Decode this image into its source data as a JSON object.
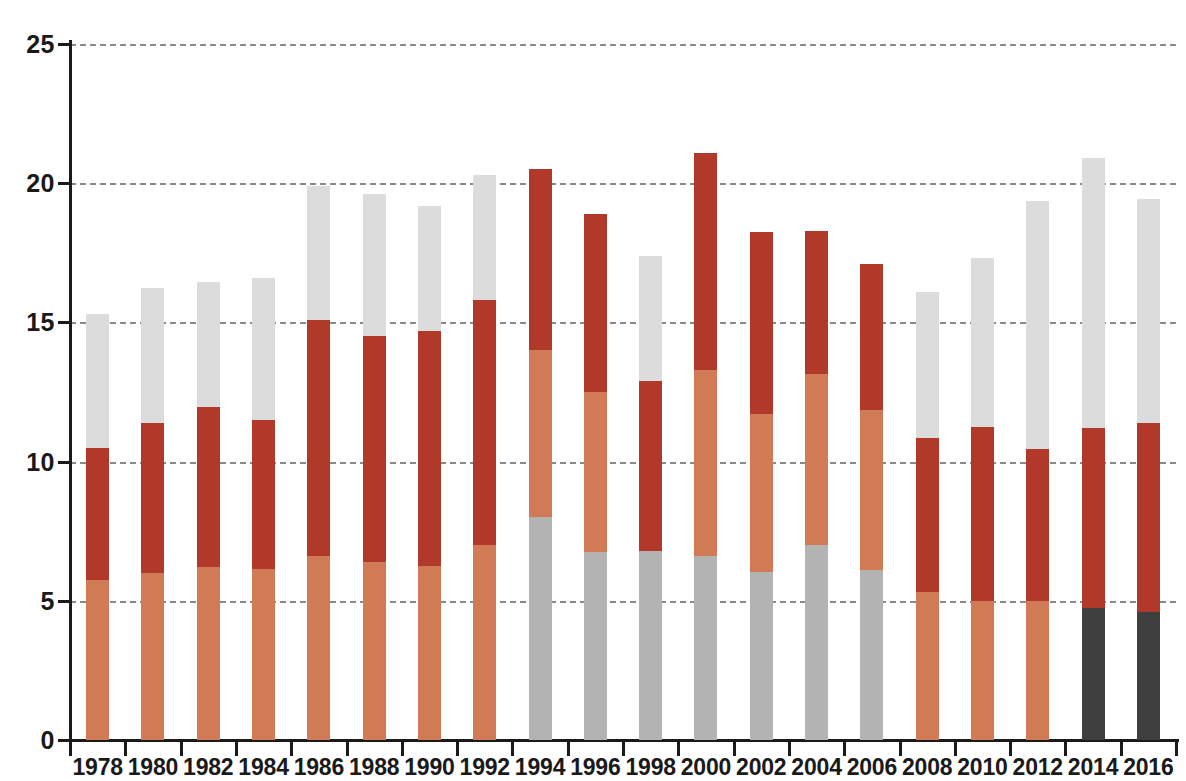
{
  "title": "",
  "axes": {
    "y_ticks": [
      0,
      5,
      10,
      15,
      20,
      25
    ],
    "y_min": 0,
    "y_max": 25,
    "x_ticks": [
      "1978",
      "1980",
      "1982",
      "1984",
      "1986",
      "1988",
      "1990",
      "1992",
      "1994",
      "1996",
      "1998",
      "2000",
      "2002",
      "2004",
      "2006",
      "2008",
      "2010",
      "2012",
      "2014",
      "2016"
    ]
  },
  "colors": {
    "salmon": "#d07a56",
    "dark_red": "#b0392a",
    "light_gray": "#dcdcdc",
    "mid_gray": "#b3b3b3",
    "charcoal": "#3f3f3f",
    "axis": "#1a1a1a",
    "gridline": "#8a8a8a",
    "background": "#ffffff"
  },
  "chart_data": {
    "type": "bar",
    "title": "",
    "xlabel": "",
    "ylabel": "",
    "ylim": [
      0,
      25
    ],
    "grid": true,
    "stacked": true,
    "legend": "none",
    "categories": [
      "1978",
      "1980",
      "1982",
      "1984",
      "1986",
      "1988",
      "1990",
      "1992",
      "1994",
      "1996",
      "1998",
      "2000",
      "2002",
      "2004",
      "2006",
      "2008",
      "2010",
      "2012",
      "2014",
      "2016"
    ],
    "series": [
      {
        "name": "salmon",
        "color": "#d07a56",
        "values": [
          5.75,
          6.0,
          6.2,
          6.15,
          6.6,
          6.4,
          6.25,
          7.0,
          0,
          0,
          0,
          0,
          0,
          0,
          0,
          5.3,
          5.0,
          5.0,
          0,
          0
        ]
      },
      {
        "name": "mid-gray",
        "color": "#b3b3b3",
        "values": [
          0,
          0,
          0,
          0,
          0,
          0,
          0,
          0,
          8.0,
          6.75,
          6.8,
          6.6,
          6.05,
          7.0,
          6.1,
          0,
          0,
          0,
          0,
          0
        ]
      },
      {
        "name": "charcoal",
        "color": "#3f3f3f",
        "values": [
          0,
          0,
          0,
          0,
          0,
          0,
          0,
          0,
          0,
          0,
          0,
          0,
          0,
          0,
          0,
          0,
          0,
          0,
          4.75,
          4.6
        ]
      },
      {
        "name": "salmon-upper",
        "color": "#d07a56",
        "values": [
          0,
          0,
          0,
          0,
          0,
          0,
          0,
          0,
          6.0,
          5.75,
          0,
          6.7,
          5.65,
          6.15,
          5.75,
          0,
          0,
          0,
          0,
          0
        ]
      },
      {
        "name": "dark-red",
        "color": "#b0392a",
        "values": [
          4.75,
          5.4,
          5.75,
          5.35,
          8.5,
          8.1,
          8.45,
          8.8,
          6.5,
          6.4,
          6.1,
          7.8,
          6.55,
          5.15,
          5.25,
          5.55,
          6.25,
          5.45,
          6.45,
          6.8
        ]
      },
      {
        "name": "light-gray",
        "color": "#dcdcdc",
        "values": [
          4.8,
          4.85,
          4.5,
          5.1,
          4.8,
          5.1,
          4.5,
          4.5,
          0,
          0,
          4.5,
          0,
          0,
          0,
          0,
          5.25,
          6.05,
          8.9,
          9.7,
          8.05
        ]
      }
    ],
    "totals": [
      15.3,
      16.25,
      16.45,
      16.6,
      19.9,
      19.6,
      19.2,
      20.3,
      20.5,
      18.9,
      17.4,
      21.1,
      18.25,
      18.3,
      17.1,
      16.1,
      17.3,
      19.35,
      20.9,
      19.45
    ],
    "bars": [
      {
        "year": "1978",
        "segments": [
          {
            "color": "salmon",
            "from": 0,
            "to": 5.75
          },
          {
            "color": "dark_red",
            "from": 5.75,
            "to": 10.5
          },
          {
            "color": "light_gray",
            "from": 10.5,
            "to": 15.3
          }
        ]
      },
      {
        "year": "1980",
        "segments": [
          {
            "color": "salmon",
            "from": 0,
            "to": 6.0
          },
          {
            "color": "dark_red",
            "from": 6.0,
            "to": 11.4
          },
          {
            "color": "light_gray",
            "from": 11.4,
            "to": 16.25
          }
        ]
      },
      {
        "year": "1982",
        "segments": [
          {
            "color": "salmon",
            "from": 0,
            "to": 6.2
          },
          {
            "color": "dark_red",
            "from": 6.2,
            "to": 11.95
          },
          {
            "color": "light_gray",
            "from": 11.95,
            "to": 16.45
          }
        ]
      },
      {
        "year": "1984",
        "segments": [
          {
            "color": "salmon",
            "from": 0,
            "to": 6.15
          },
          {
            "color": "dark_red",
            "from": 6.15,
            "to": 11.5
          },
          {
            "color": "light_gray",
            "from": 11.5,
            "to": 16.6
          }
        ]
      },
      {
        "year": "1986",
        "segments": [
          {
            "color": "salmon",
            "from": 0,
            "to": 6.6
          },
          {
            "color": "dark_red",
            "from": 6.6,
            "to": 15.1
          },
          {
            "color": "light_gray",
            "from": 15.1,
            "to": 19.9
          }
        ]
      },
      {
        "year": "1988",
        "segments": [
          {
            "color": "salmon",
            "from": 0,
            "to": 6.4
          },
          {
            "color": "dark_red",
            "from": 6.4,
            "to": 14.5
          },
          {
            "color": "light_gray",
            "from": 14.5,
            "to": 19.6
          }
        ]
      },
      {
        "year": "1990",
        "segments": [
          {
            "color": "salmon",
            "from": 0,
            "to": 6.25
          },
          {
            "color": "dark_red",
            "from": 6.25,
            "to": 14.7
          },
          {
            "color": "light_gray",
            "from": 14.7,
            "to": 19.2
          }
        ]
      },
      {
        "year": "1992",
        "segments": [
          {
            "color": "salmon",
            "from": 0,
            "to": 7.0
          },
          {
            "color": "dark_red",
            "from": 7.0,
            "to": 15.8
          },
          {
            "color": "light_gray",
            "from": 15.8,
            "to": 20.3
          }
        ]
      },
      {
        "year": "1994",
        "segments": [
          {
            "color": "mid_gray",
            "from": 0,
            "to": 8.0
          },
          {
            "color": "salmon",
            "from": 8.0,
            "to": 14.0
          },
          {
            "color": "dark_red",
            "from": 14.0,
            "to": 20.5
          }
        ]
      },
      {
        "year": "1996",
        "segments": [
          {
            "color": "mid_gray",
            "from": 0,
            "to": 6.75
          },
          {
            "color": "salmon",
            "from": 6.75,
            "to": 12.5
          },
          {
            "color": "dark_red",
            "from": 12.5,
            "to": 18.9
          }
        ]
      },
      {
        "year": "1998",
        "segments": [
          {
            "color": "mid_gray",
            "from": 0,
            "to": 6.8
          },
          {
            "color": "dark_red",
            "from": 6.8,
            "to": 12.9
          },
          {
            "color": "light_gray",
            "from": 12.9,
            "to": 17.4
          }
        ]
      },
      {
        "year": "2000",
        "segments": [
          {
            "color": "mid_gray",
            "from": 0,
            "to": 6.6
          },
          {
            "color": "salmon",
            "from": 6.6,
            "to": 13.3
          },
          {
            "color": "dark_red",
            "from": 13.3,
            "to": 21.1
          }
        ]
      },
      {
        "year": "2002",
        "segments": [
          {
            "color": "mid_gray",
            "from": 0,
            "to": 6.05
          },
          {
            "color": "salmon",
            "from": 6.05,
            "to": 11.7
          },
          {
            "color": "dark_red",
            "from": 11.7,
            "to": 18.25
          }
        ]
      },
      {
        "year": "2004",
        "segments": [
          {
            "color": "mid_gray",
            "from": 0,
            "to": 7.0
          },
          {
            "color": "salmon",
            "from": 7.0,
            "to": 13.15
          },
          {
            "color": "dark_red",
            "from": 13.15,
            "to": 18.3
          }
        ]
      },
      {
        "year": "2006",
        "segments": [
          {
            "color": "mid_gray",
            "from": 0,
            "to": 6.1
          },
          {
            "color": "salmon",
            "from": 6.1,
            "to": 11.85
          },
          {
            "color": "dark_red",
            "from": 11.85,
            "to": 17.1
          }
        ]
      },
      {
        "year": "2008",
        "segments": [
          {
            "color": "salmon",
            "from": 0,
            "to": 5.3
          },
          {
            "color": "dark_red",
            "from": 5.3,
            "to": 10.85
          },
          {
            "color": "light_gray",
            "from": 10.85,
            "to": 16.1
          }
        ]
      },
      {
        "year": "2010",
        "segments": [
          {
            "color": "salmon",
            "from": 0,
            "to": 5.0
          },
          {
            "color": "dark_red",
            "from": 5.0,
            "to": 11.25
          },
          {
            "color": "light_gray",
            "from": 11.25,
            "to": 17.3
          }
        ]
      },
      {
        "year": "2012",
        "segments": [
          {
            "color": "salmon",
            "from": 0,
            "to": 5.0
          },
          {
            "color": "dark_red",
            "from": 5.0,
            "to": 10.45
          },
          {
            "color": "light_gray",
            "from": 10.45,
            "to": 19.35
          }
        ]
      },
      {
        "year": "2014",
        "segments": [
          {
            "color": "charcoal",
            "from": 0,
            "to": 4.75
          },
          {
            "color": "dark_red",
            "from": 4.75,
            "to": 11.2
          },
          {
            "color": "light_gray",
            "from": 11.2,
            "to": 20.9
          }
        ]
      },
      {
        "year": "2016",
        "segments": [
          {
            "color": "charcoal",
            "from": 0,
            "to": 4.6
          },
          {
            "color": "dark_red",
            "from": 4.6,
            "to": 11.4
          },
          {
            "color": "light_gray",
            "from": 11.4,
            "to": 19.45
          }
        ]
      }
    ]
  }
}
